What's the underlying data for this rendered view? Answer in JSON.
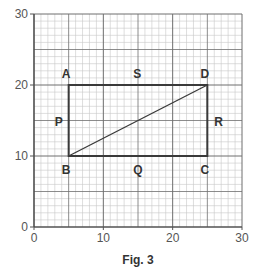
{
  "figure": {
    "caption": "Fig. 3",
    "axes": {
      "x_min": 0,
      "x_max": 30,
      "y_min": 0,
      "y_max": 30,
      "x_ticks": [
        0,
        10,
        20,
        30
      ],
      "y_ticks": [
        0,
        10,
        20,
        30
      ],
      "minor_step": 1,
      "major_step": 5
    },
    "points": [
      {
        "label": "A",
        "x": 5,
        "y": 20,
        "lx": -1.0,
        "ly": 1.0
      },
      {
        "label": "B",
        "x": 5,
        "y": 10,
        "lx": -1.0,
        "ly": -2.5
      },
      {
        "label": "C",
        "x": 25,
        "y": 10,
        "lx": -1.0,
        "ly": -2.5
      },
      {
        "label": "D",
        "x": 25,
        "y": 20,
        "lx": -1.0,
        "ly": 1.0
      },
      {
        "label": "P",
        "x": 3,
        "y": 15,
        "lx": 0,
        "ly": -0.8
      },
      {
        "label": "Q",
        "x": 15,
        "y": 10,
        "lx": -0.7,
        "ly": -2.5
      },
      {
        "label": "R",
        "x": 26,
        "y": 15,
        "lx": 0,
        "ly": -0.8
      },
      {
        "label": "S",
        "x": 15,
        "y": 20,
        "lx": -0.7,
        "ly": 1.0
      }
    ],
    "rectangle": [
      "A",
      "D",
      "C",
      "B"
    ],
    "diagonal": [
      "B",
      "D"
    ],
    "colors": {
      "minor_grid": "#c8c8c8",
      "major_grid": "#6e6e6e",
      "shape": "#3a3a3a",
      "text": "#333333"
    }
  }
}
